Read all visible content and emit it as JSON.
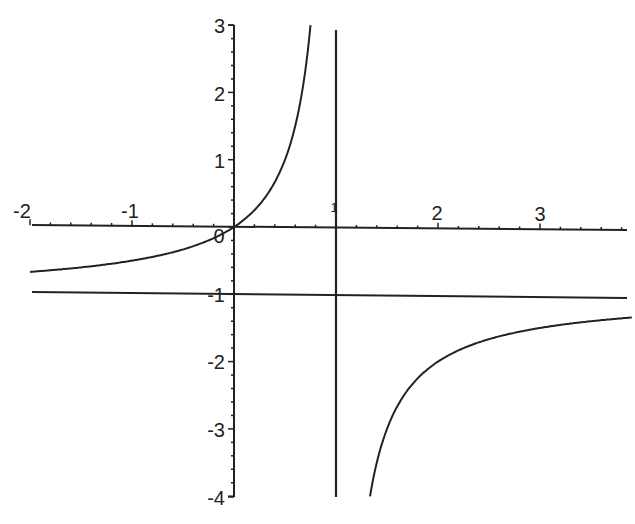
{
  "chart_data": {
    "type": "line",
    "title": "",
    "xlabel": "",
    "ylabel": "",
    "function": "y = x/(1-x)",
    "xlim": [
      -2,
      3.9
    ],
    "ylim": [
      -4,
      3
    ],
    "grid": false,
    "legend": null,
    "x_ticks": [
      -2,
      -1,
      0,
      1,
      2,
      3
    ],
    "x_tick_labels": [
      "-2",
      "-1",
      "0",
      "1",
      "2",
      "3"
    ],
    "y_ticks": [
      -4,
      -3,
      -2,
      -1,
      1,
      2,
      3
    ],
    "y_tick_labels": [
      "-4",
      "-3",
      "-2",
      "-1",
      "1",
      "2",
      "3"
    ],
    "asymptotes": {
      "vertical": {
        "x": 1
      },
      "horizontal": {
        "y": -1
      }
    },
    "series": [
      {
        "name": "left branch",
        "x": [
          -2,
          -1.5,
          -1,
          -0.5,
          0,
          0.25,
          0.5,
          0.6,
          0.7,
          0.75
        ],
        "y": [
          -0.667,
          -0.6,
          -0.5,
          -0.333,
          0,
          0.333,
          1,
          1.5,
          2.333,
          3
        ]
      },
      {
        "name": "right branch",
        "x": [
          1.33,
          1.5,
          1.75,
          2,
          2.5,
          3,
          3.5,
          3.9
        ],
        "y": [
          -4,
          -3,
          -2.333,
          -2,
          -1.667,
          -1.5,
          -1.4,
          -1.345
        ]
      }
    ]
  },
  "axes": {
    "x_labels": {
      "n2": "-2",
      "n1": "-1",
      "zero": "0",
      "one": "1",
      "two": "2",
      "three": "3"
    },
    "y_labels": {
      "p3": "3",
      "p2": "2",
      "p1": "1",
      "n1": "-1",
      "n2": "-2",
      "n3": "-3",
      "n4": "-4"
    }
  }
}
